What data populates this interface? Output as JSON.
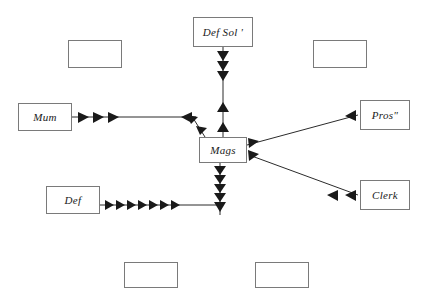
{
  "diagram": {
    "type": "flow-diagram",
    "background_color": "#ffffff",
    "box_border_color": "#7a7a7a",
    "line_color": "#2b2b2b",
    "nodes": [
      {
        "id": "def-sol",
        "label": "Def Sol '",
        "x": 193,
        "y": 17,
        "w": 60,
        "h": 30
      },
      {
        "id": "empty-top-left",
        "label": "",
        "x": 68,
        "y": 40,
        "w": 54,
        "h": 28
      },
      {
        "id": "empty-top-right",
        "label": "",
        "x": 313,
        "y": 40,
        "w": 54,
        "h": 28
      },
      {
        "id": "mum",
        "label": "Mum",
        "x": 18,
        "y": 103,
        "w": 54,
        "h": 28
      },
      {
        "id": "pros",
        "label": "Pros\"",
        "x": 360,
        "y": 100,
        "w": 50,
        "h": 30
      },
      {
        "id": "mags",
        "label": "Mags",
        "x": 199,
        "y": 137,
        "w": 48,
        "h": 26
      },
      {
        "id": "clerk",
        "label": "Clerk",
        "x": 360,
        "y": 180,
        "w": 50,
        "h": 30
      },
      {
        "id": "def",
        "label": "Def",
        "x": 46,
        "y": 186,
        "w": 54,
        "h": 28
      },
      {
        "id": "empty-bottom-left",
        "label": "",
        "x": 124,
        "y": 262,
        "w": 54,
        "h": 26
      },
      {
        "id": "empty-bottom-right",
        "label": "",
        "x": 255,
        "y": 262,
        "w": 54,
        "h": 26
      }
    ],
    "edges": [
      {
        "id": "def-sol-to-mags",
        "from": "def-sol",
        "to": "mags",
        "direction": "down",
        "arrow_count": 3
      },
      {
        "id": "mags-to-def-sol",
        "from": "mags",
        "to": "def-sol",
        "direction": "up",
        "arrow_count": 2
      },
      {
        "id": "mum-to-junction",
        "from": "mum",
        "to": "mags",
        "direction": "right",
        "arrow_count": 3
      },
      {
        "id": "junction-to-mum",
        "from": "mags",
        "to": "mum",
        "direction": "left",
        "arrow_count": 2
      },
      {
        "id": "mags-diag-upleft",
        "from": "mags",
        "to": "mum",
        "direction": "up-left",
        "arrow_count": 2
      },
      {
        "id": "mags-to-pros",
        "from": "mags",
        "to": "pros",
        "direction": "up-right",
        "arrow_count": 1
      },
      {
        "id": "pros-to-mags",
        "from": "pros",
        "to": "mags",
        "direction": "down-left",
        "arrow_count": 1
      },
      {
        "id": "mags-to-clerk",
        "from": "mags",
        "to": "clerk",
        "direction": "down-right",
        "arrow_count": 2
      },
      {
        "id": "clerk-to-mags",
        "from": "clerk",
        "to": "mags",
        "direction": "up-left",
        "arrow_count": 1
      },
      {
        "id": "def-to-mags",
        "from": "def",
        "to": "mags",
        "direction": "right",
        "arrow_count": 8
      },
      {
        "id": "mags-down-column",
        "from": "mags",
        "to": "def",
        "direction": "down",
        "arrow_count": 5
      }
    ]
  }
}
